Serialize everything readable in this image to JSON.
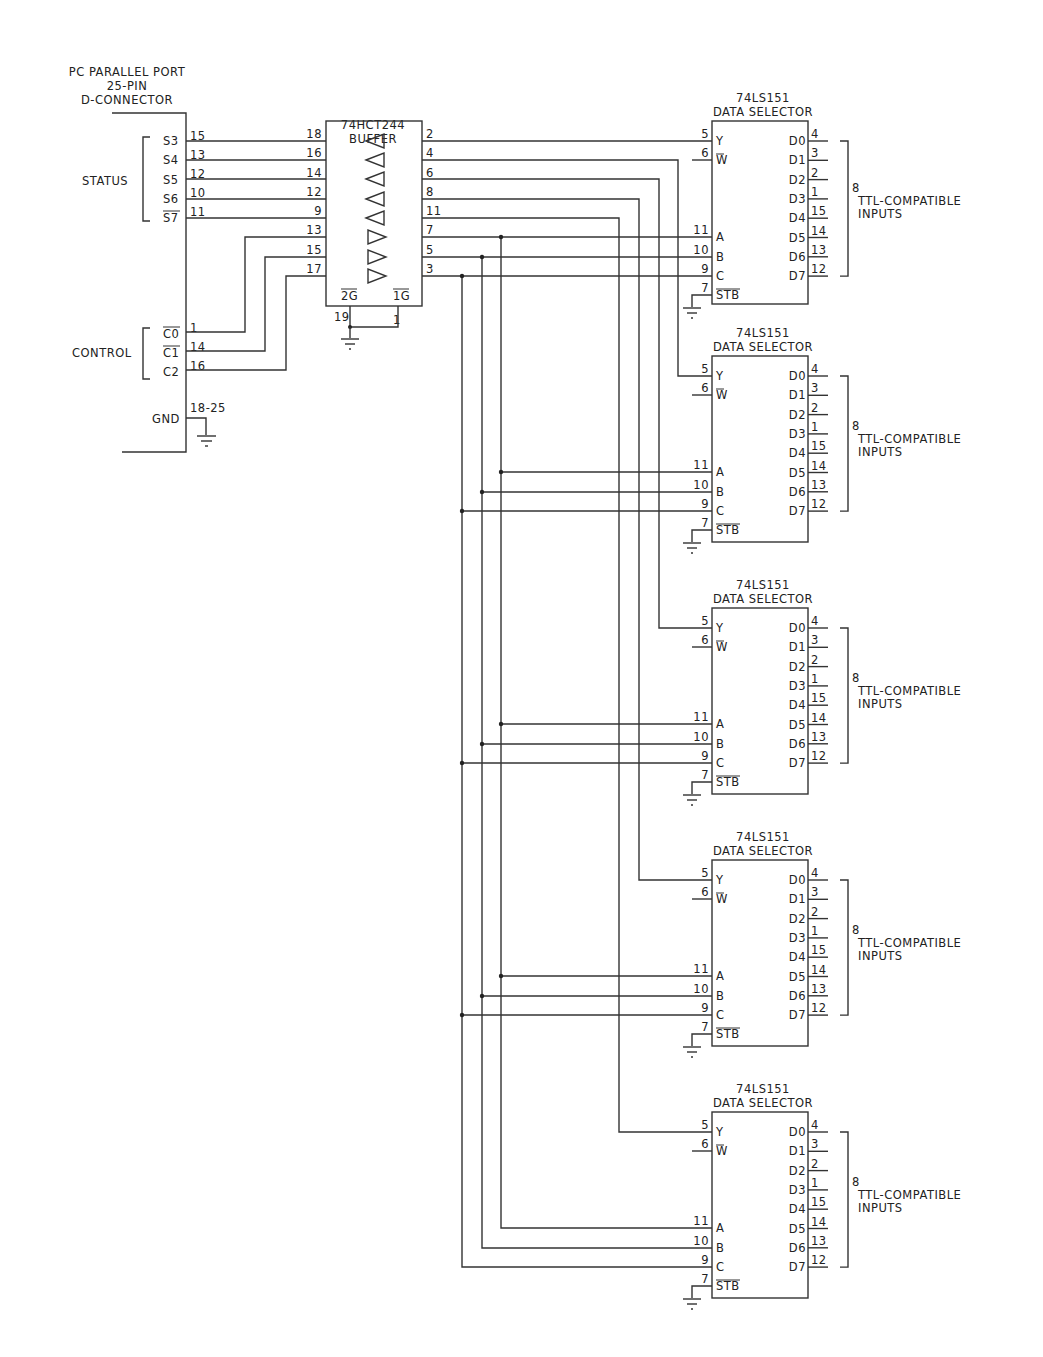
{
  "connector": {
    "title_line1": "PC PARALLEL PORT",
    "title_line2": "25-PIN",
    "title_line3": "D-CONNECTOR",
    "status_group_label": "STATUS",
    "control_group_label": "CONTROL",
    "gnd_label": "GND",
    "gnd_pins": "18-25",
    "status_pins": [
      {
        "name": "S3",
        "pin": "15"
      },
      {
        "name": "S4",
        "pin": "13"
      },
      {
        "name": "S5",
        "pin": "12"
      },
      {
        "name": "S6",
        "pin": "10"
      },
      {
        "name": "S7",
        "pin": "11",
        "inverted": true
      }
    ],
    "control_pins": [
      {
        "name": "C0",
        "pin": "1",
        "inverted": true
      },
      {
        "name": "C1",
        "pin": "14",
        "inverted": true
      },
      {
        "name": "C2",
        "pin": "16"
      }
    ]
  },
  "buffer": {
    "part": "74HCT244",
    "label": "BUFFER",
    "left_pins": [
      "18",
      "16",
      "14",
      "12",
      "9",
      "13",
      "15",
      "17"
    ],
    "right_pins": [
      "2",
      "4",
      "6",
      "8",
      "11",
      "7",
      "5",
      "3"
    ],
    "enable_2g": "2G",
    "enable_1g": "1G",
    "pin_19": "19",
    "pin_1": "1"
  },
  "selectors": [
    {
      "part": "74LS151",
      "label": "DATA SELECTOR",
      "inputs_note_count": "8",
      "inputs_note_1": "TTL-COMPATIBLE",
      "inputs_note_2": "INPUTS"
    },
    {
      "part": "74LS151",
      "label": "DATA SELECTOR",
      "inputs_note_count": "8",
      "inputs_note_1": "TTL-COMPATIBLE",
      "inputs_note_2": "INPUTS"
    },
    {
      "part": "74LS151",
      "label": "DATA SELECTOR",
      "inputs_note_count": "8",
      "inputs_note_1": "TTL-COMPATIBLE",
      "inputs_note_2": "INPUTS"
    },
    {
      "part": "74LS151",
      "label": "DATA SELECTOR",
      "inputs_note_count": "8",
      "inputs_note_1": "TTL-COMPATIBLE",
      "inputs_note_2": "INPUTS"
    },
    {
      "part": "74LS151",
      "label": "DATA SELECTOR",
      "inputs_note_count": "8",
      "inputs_note_1": "TTL-COMPATIBLE",
      "inputs_note_2": "INPUTS"
    }
  ],
  "selector_pins": {
    "left": [
      {
        "name": "Y",
        "pin": "5"
      },
      {
        "name": "W",
        "pin": "6",
        "inverted": true
      },
      {
        "name": "A",
        "pin": "11"
      },
      {
        "name": "B",
        "pin": "10"
      },
      {
        "name": "C",
        "pin": "9"
      },
      {
        "name": "STB",
        "pin": "7",
        "inverted": true
      }
    ],
    "right": [
      {
        "name": "D0",
        "pin": "4"
      },
      {
        "name": "D1",
        "pin": "3"
      },
      {
        "name": "D2",
        "pin": "2"
      },
      {
        "name": "D3",
        "pin": "1"
      },
      {
        "name": "D4",
        "pin": "15"
      },
      {
        "name": "D5",
        "pin": "14"
      },
      {
        "name": "D6",
        "pin": "13"
      },
      {
        "name": "D7",
        "pin": "12"
      }
    ]
  }
}
